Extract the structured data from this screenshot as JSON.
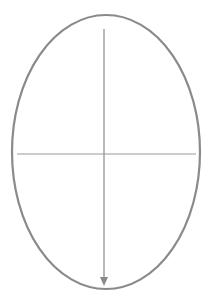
{
  "diagram": {
    "shape": "ellipse",
    "ellipse": {
      "cx": 106,
      "cy": 152,
      "rx": 94,
      "ry": 137,
      "stroke": "#8a8a8a",
      "stroke_width": 2.2
    },
    "vertical_axis": {
      "x": 104,
      "y1": 29,
      "y2": 286,
      "stroke": "#8a8a8a",
      "arrow": "down"
    },
    "horizontal_axis": {
      "y": 154,
      "x1": 17,
      "x2": 196,
      "stroke": "#9a9a9a"
    }
  }
}
